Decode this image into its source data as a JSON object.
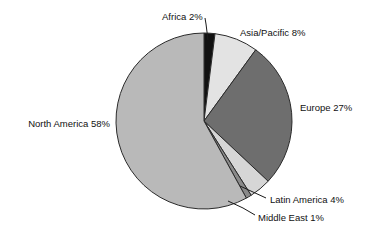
{
  "chart_data": {
    "type": "pie",
    "title": "",
    "subtitle": "",
    "xlabel": "",
    "ylabel": "",
    "grid": false,
    "legend_position": "none",
    "label_style": "outside-with-leader-lines",
    "start_angle_deg": 0,
    "direction": "clockwise",
    "categories": [
      "Africa",
      "Asia/Pacific",
      "Europe",
      "Latin America",
      "Middle East",
      "North America"
    ],
    "values": [
      2,
      8,
      27,
      4,
      1,
      58
    ],
    "value_unit": "%",
    "total": 100,
    "slices": [
      {
        "label": "Africa 2%",
        "name": "Africa",
        "value": 2,
        "color": "#111111",
        "label_x": 162,
        "label_y": 17,
        "label_anchor": "start",
        "leader": true,
        "leader_points": "205,18 206,24 208,40"
      },
      {
        "label": "Asia/Pacific 8%",
        "name": "Asia/Pacific",
        "value": 8,
        "color": "#e3e3e3",
        "label_x": 240,
        "label_y": 33,
        "label_anchor": "start",
        "leader": false,
        "leader_points": ""
      },
      {
        "label": "Europe 27%",
        "name": "Europe",
        "value": 27,
        "color": "#6e6e6e",
        "label_x": 300,
        "label_y": 108,
        "label_anchor": "start",
        "leader": false,
        "leader_points": ""
      },
      {
        "label": "Latin America 4%",
        "name": "Latin America",
        "value": 4,
        "color": "#d6d6d6",
        "label_x": 270,
        "label_y": 200,
        "label_anchor": "start",
        "leader": true,
        "leader_points": "266,198 253,192 240,186"
      },
      {
        "label": "Middle East 1%",
        "name": "Middle East",
        "value": 1,
        "color": "#8a8a8a",
        "label_x": 258,
        "label_y": 218,
        "label_anchor": "start",
        "leader": true,
        "leader_points": "255,215 243,208 228,201"
      },
      {
        "label": "North America 58%",
        "name": "North America",
        "value": 58,
        "color": "#b9b9b9",
        "label_x": 110,
        "label_y": 124,
        "label_anchor": "end",
        "leader": false,
        "leader_points": ""
      }
    ],
    "geometry": {
      "center_x": 204,
      "center_y": 121,
      "radius": 88
    },
    "colors": {
      "background": "#ffffff",
      "outline": "#2b2b2b",
      "text": "#111111"
    }
  }
}
